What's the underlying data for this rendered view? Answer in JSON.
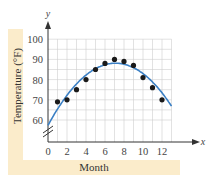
{
  "chart_data": {
    "type": "scatter",
    "title": "",
    "xlabel": "Month",
    "ylabel": "Temperature (°F)",
    "x_axis_letter": "x",
    "y_axis_letter": "y",
    "xlim": [
      0,
      13
    ],
    "ylim": [
      60,
      100
    ],
    "x_ticks": [
      "0",
      "2",
      "4",
      "6",
      "8",
      "10",
      "12"
    ],
    "y_ticks": [
      "60",
      "70",
      "80",
      "90",
      "100"
    ],
    "grid": true,
    "axis_break": true,
    "series": [
      {
        "name": "Observed temperatures",
        "kind": "scatter",
        "x": [
          1,
          2,
          3,
          4,
          5,
          6,
          7,
          8,
          9,
          10,
          11,
          12
        ],
        "y": [
          69,
          70,
          75,
          80,
          85,
          88,
          90,
          89,
          87,
          81,
          76,
          70
        ]
      },
      {
        "name": "Quadratic model",
        "kind": "line",
        "x": [
          0,
          1,
          2,
          3,
          4,
          5,
          6,
          7,
          8,
          9,
          10,
          11,
          12,
          13
        ],
        "y": [
          57,
          65.5,
          72.3,
          77.8,
          82.2,
          85.4,
          87.4,
          88.1,
          87.6,
          85.8,
          82.7,
          78.4,
          72.8,
          64
        ]
      }
    ],
    "colors": {
      "points": "#1a1a1a",
      "curve": "#3a7fc4",
      "grid": "#cfcfcf",
      "band": "#fbeccb"
    }
  }
}
